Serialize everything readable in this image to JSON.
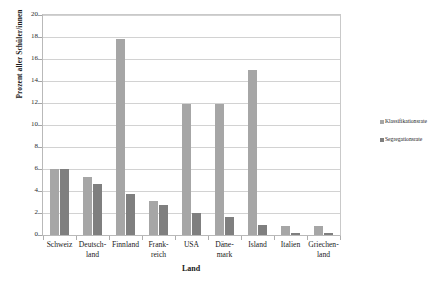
{
  "chart_data": {
    "type": "bar",
    "title": "",
    "xlabel": "Land",
    "ylabel": "Prozent aller Schüler/innen",
    "ylim": [
      0,
      20
    ],
    "ytick_step": 2,
    "grid": true,
    "legend_position": "right",
    "yticks": [
      "20",
      "18",
      "16",
      "14",
      "12",
      "10",
      "8",
      "6",
      "4",
      "2",
      "0"
    ],
    "categories": [
      "Schweiz",
      "Deutsch-\nland",
      "Finnland",
      "Frank-\nreich",
      "USA",
      "Däne-\nmark",
      "Island",
      "Italien",
      "Griechen-\nland"
    ],
    "category_lines": [
      [
        "Schweiz"
      ],
      [
        "Deutsch-",
        "land"
      ],
      [
        "Finnland"
      ],
      [
        "Frank-",
        "reich"
      ],
      [
        "USA"
      ],
      [
        "Däne-",
        "mark"
      ],
      [
        "Island"
      ],
      [
        "Italien"
      ],
      [
        "Griechen-",
        "land"
      ]
    ],
    "series": [
      {
        "name": "Klassifikationsrate",
        "color": "#a6a6a6",
        "values": [
          6.0,
          5.3,
          17.8,
          3.1,
          11.9,
          11.9,
          15.0,
          0.8,
          0.8
        ]
      },
      {
        "name": "Segregationsrate",
        "color": "#7f7f7f",
        "values": [
          6.0,
          4.6,
          3.7,
          2.7,
          2.0,
          1.6,
          0.9,
          0.2,
          0.2
        ]
      }
    ]
  },
  "legend": {
    "items": [
      {
        "label": "Klassifikationsrate",
        "color": "#a6a6a6"
      },
      {
        "label": "Segregationsrate",
        "color": "#7f7f7f"
      }
    ]
  },
  "colors": {
    "klassifikationsrate": "#a6a6a6",
    "segregationsrate": "#7f7f7f",
    "gridline": "#d2d2d2",
    "axis": "#b9b9b9",
    "background": "#ffffff"
  }
}
